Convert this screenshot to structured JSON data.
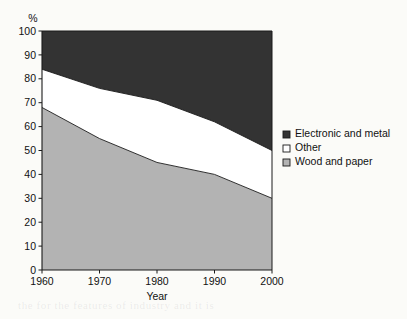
{
  "chart_data": {
    "type": "area",
    "title": "",
    "subtitle": "",
    "xlabel": "Year",
    "ylabel": "%",
    "x": [
      1960,
      1970,
      1980,
      1990,
      2000
    ],
    "categories": [
      "1960",
      "1970",
      "1980",
      "1990",
      "2000"
    ],
    "xlim": [
      1960,
      2000
    ],
    "ylim": [
      0,
      100
    ],
    "grid": false,
    "stacked": true,
    "legend_position": "right",
    "xticks": [
      "1960",
      "1970",
      "1980",
      "1990",
      "2000"
    ],
    "yticks": [
      "0",
      "10",
      "20",
      "30",
      "40",
      "50",
      "60",
      "70",
      "80",
      "90",
      "100"
    ],
    "series": [
      {
        "name": "Wood and paper",
        "color": "#b3b3b3",
        "values": [
          68,
          55,
          45,
          40,
          30
        ]
      },
      {
        "name": "Other",
        "color": "#ffffff",
        "values": [
          16,
          21,
          26,
          22,
          20
        ]
      },
      {
        "name": "Electronic and metal",
        "color": "#333333",
        "values": [
          16,
          24,
          29,
          38,
          50
        ]
      }
    ],
    "cumulative_upper_bounds": {
      "wood_and_paper": [
        68,
        55,
        45,
        40,
        30
      ],
      "wood_plus_other": [
        84,
        76,
        71,
        62,
        50
      ],
      "total": [
        100,
        100,
        100,
        100,
        100
      ]
    }
  },
  "axes": {
    "y_unit_label": "%",
    "x_title": "Year",
    "y_ticks": [
      "100",
      "90",
      "80",
      "70",
      "60",
      "50",
      "40",
      "30",
      "20",
      "10",
      "0"
    ],
    "x_ticks": [
      "1960",
      "1970",
      "1980",
      "1990",
      "2000"
    ]
  },
  "legend": {
    "items": [
      {
        "label": "Electronic and metal",
        "swatch": "filled-dark-square",
        "color": "#333333"
      },
      {
        "label": "Other",
        "swatch": "empty-white-square",
        "color": "#ffffff"
      },
      {
        "label": "Wood and paper",
        "swatch": "gray-square",
        "color": "#b3b3b3"
      }
    ]
  },
  "colors": {
    "electronic_and_metal": "#333333",
    "other": "#ffffff",
    "wood_and_paper": "#b3b3b3",
    "axis": "#1a1a1a",
    "background": "#fbfbf8"
  }
}
